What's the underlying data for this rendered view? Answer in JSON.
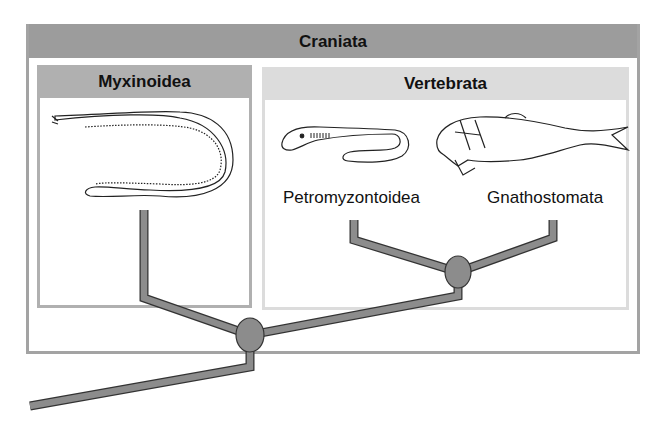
{
  "diagram": {
    "type": "cladogram",
    "outer_group": {
      "label": "Craniata"
    },
    "groups": [
      {
        "label": "Myxinoidea",
        "organism": "hagfish"
      },
      {
        "label": "Vertebrata",
        "organism_groups": [
          "Petromyzontoidea",
          "Gnathostomata"
        ]
      }
    ],
    "taxa": [
      {
        "label": "Petromyzontoidea",
        "organism": "lamprey"
      },
      {
        "label": "Gnathostomata",
        "organism": "jawed fish"
      }
    ],
    "nodes": [
      {
        "id": "craniata-node"
      },
      {
        "id": "vertebrata-node"
      }
    ],
    "colors": {
      "branch": "#8c8c8c",
      "outline": "#333333",
      "craniata_header": "#9c9c9c",
      "myxinoidea_header": "#b0b0b0",
      "vertebrata_header": "#dcdcdc"
    }
  }
}
